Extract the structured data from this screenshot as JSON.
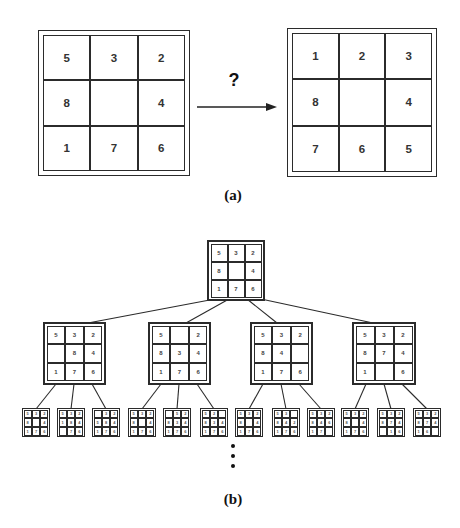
{
  "figure": {
    "part_a": {
      "label": "(a)",
      "question_mark": "?",
      "start_state": {
        "cells": [
          "5",
          "3",
          "2",
          "8",
          "",
          "4",
          "1",
          "7",
          "6"
        ]
      },
      "goal_state": {
        "cells": [
          "1",
          "2",
          "3",
          "8",
          "",
          "4",
          "7",
          "6",
          "5"
        ]
      }
    },
    "part_b": {
      "label": "(b)",
      "root": {
        "cells": [
          "5",
          "3",
          "2",
          "8",
          "",
          "4",
          "1",
          "7",
          "6"
        ]
      },
      "level2": [
        {
          "cells": [
            "5",
            "3",
            "2",
            "",
            "8",
            "4",
            "1",
            "7",
            "6"
          ]
        },
        {
          "cells": [
            "5",
            "",
            "2",
            "8",
            "3",
            "4",
            "1",
            "7",
            "6"
          ]
        },
        {
          "cells": [
            "5",
            "3",
            "2",
            "8",
            "4",
            "",
            "1",
            "7",
            "6"
          ]
        },
        {
          "cells": [
            "5",
            "3",
            "2",
            "8",
            "7",
            "4",
            "1",
            "",
            "6"
          ]
        }
      ],
      "level3": [
        {
          "cells": [
            "5",
            "3",
            "2",
            "8",
            "",
            "4",
            "1",
            "7",
            "6"
          ]
        },
        {
          "cells": [
            "5",
            "3",
            "2",
            "1",
            "8",
            "4",
            "",
            "7",
            "6"
          ]
        },
        {
          "cells": [
            "",
            "3",
            "2",
            "5",
            "8",
            "4",
            "1",
            "7",
            "6"
          ]
        },
        {
          "cells": [
            "5",
            "3",
            "2",
            "8",
            "",
            "4",
            "1",
            "7",
            "6"
          ]
        },
        {
          "cells": [
            "",
            "5",
            "2",
            "8",
            "3",
            "4",
            "1",
            "7",
            "6"
          ]
        },
        {
          "cells": [
            "5",
            "2",
            "",
            "8",
            "3",
            "4",
            "1",
            "7",
            "6"
          ]
        },
        {
          "cells": [
            "5",
            "3",
            "2",
            "8",
            "",
            "4",
            "1",
            "7",
            "6"
          ]
        },
        {
          "cells": [
            "5",
            "3",
            "",
            "8",
            "4",
            "2",
            "1",
            "7",
            "6"
          ]
        },
        {
          "cells": [
            "5",
            "3",
            "2",
            "8",
            "4",
            "6",
            "1",
            "7",
            ""
          ]
        },
        {
          "cells": [
            "5",
            "3",
            "2",
            "8",
            "",
            "4",
            "1",
            "7",
            "6"
          ]
        },
        {
          "cells": [
            "5",
            "3",
            "2",
            "8",
            "7",
            "4",
            "",
            "1",
            "6"
          ]
        },
        {
          "cells": [
            "5",
            "3",
            "2",
            "8",
            "7",
            "4",
            "1",
            "6",
            ""
          ]
        }
      ]
    },
    "colors": {
      "background": "#ffffff",
      "line": "#2b2b2b",
      "digit": "#333333"
    }
  }
}
